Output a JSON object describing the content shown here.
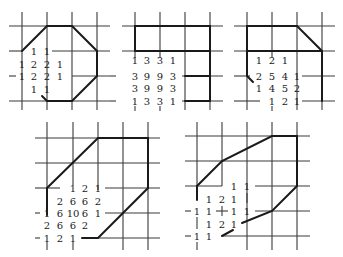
{
  "panels": [
    {
      "id": "panel-1",
      "rows": [
        [
          "1",
          "1"
        ],
        [
          "1",
          "2",
          "2",
          "1"
        ],
        [
          "1",
          "2",
          "2",
          "1"
        ],
        [
          "1",
          "1"
        ]
      ]
    },
    {
      "id": "panel-2",
      "rows": [
        [
          "1",
          "3",
          "3",
          "1"
        ],
        [
          "3",
          "9",
          "9",
          "3"
        ],
        [
          "3",
          "9",
          "9",
          "3"
        ],
        [
          "1",
          "3",
          "3",
          "1"
        ]
      ]
    },
    {
      "id": "panel-3",
      "rows": [
        [
          "1",
          "2",
          "1"
        ],
        [
          "2",
          "5",
          "4",
          "1"
        ],
        [
          "1",
          "4",
          "5",
          "2"
        ],
        [
          "1",
          "2",
          "1"
        ]
      ]
    },
    {
      "id": "panel-4",
      "rows": [
        [
          "1",
          "2",
          "1"
        ],
        [
          "2",
          "6",
          "6",
          "2"
        ],
        [
          "1",
          "6",
          "10",
          "6",
          "1"
        ],
        [
          "2",
          "6",
          "6",
          "2"
        ],
        [
          "1",
          "2",
          "1"
        ]
      ]
    },
    {
      "id": "panel-5",
      "rows": [
        [
          "1",
          "1"
        ],
        [
          "1",
          "2",
          "1"
        ],
        [
          "1",
          "1",
          "1",
          "1"
        ],
        [
          "1",
          "2",
          "1"
        ],
        [
          "1",
          "1"
        ]
      ]
    }
  ],
  "colors": {
    "ink": "#1a1a1a",
    "grid": "#3a3a3a",
    "background": "#ffffff"
  }
}
